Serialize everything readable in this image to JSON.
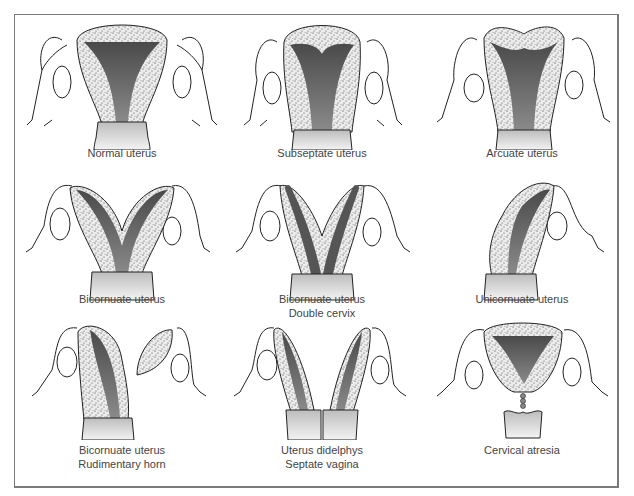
{
  "figure": {
    "panels": [
      {
        "id": "normal",
        "caption_lines": [
          "Normal uterus"
        ]
      },
      {
        "id": "subseptate",
        "caption_lines": [
          "Subseptate uterus"
        ]
      },
      {
        "id": "arcuate",
        "caption_lines": [
          "Arcuate uterus"
        ]
      },
      {
        "id": "bicornuate",
        "caption_lines": [
          "Bicornuate uterus"
        ]
      },
      {
        "id": "bicornuate-double-cervix",
        "caption_lines": [
          "Bicornuate uterus",
          "Double cervix"
        ]
      },
      {
        "id": "unicornuate",
        "caption_lines": [
          "Unicornuate uterus"
        ]
      },
      {
        "id": "bicornuate-rudimentary-horn",
        "caption_lines": [
          "Bicornuate uterus",
          "Rudimentary horn"
        ]
      },
      {
        "id": "didelphys",
        "caption_lines": [
          "Uterus didelphys",
          "Septate vagina"
        ]
      },
      {
        "id": "cervical-atresia",
        "caption_lines": [
          "Cervical atresia"
        ]
      }
    ]
  },
  "colors": {
    "wall_fill": "#e4e4e4",
    "cavity": "#6f6f6f",
    "outline": "#222222",
    "cervix": "#d0d0d0",
    "border": "#7a7a7a",
    "caption": "#444444"
  }
}
